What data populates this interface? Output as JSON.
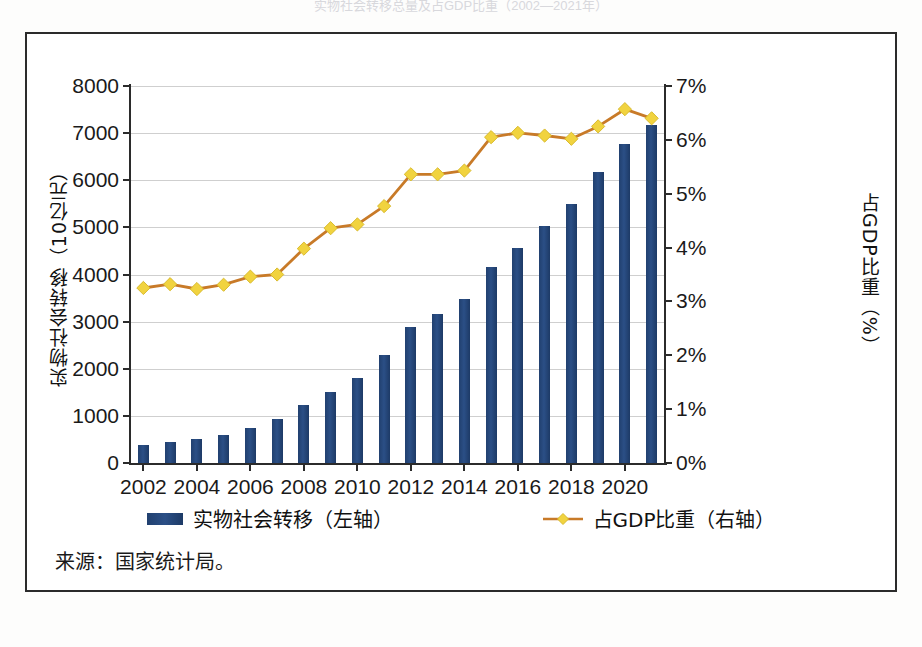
{
  "figure": {
    "title_faint": "实物社会转移总量及占GDP比重（2002—2021年）",
    "source_note": "来源：国家统计局。"
  },
  "axes": {
    "left_title": "实物社会转移（10亿元）",
    "right_title": "占GDP比重（%）",
    "left_ticks": [
      "0",
      "1000",
      "2000",
      "3000",
      "4000",
      "5000",
      "6000",
      "7000",
      "8000"
    ],
    "right_ticks": [
      "0%",
      "1%",
      "2%",
      "3%",
      "4%",
      "5%",
      "6%",
      "7%"
    ],
    "x_ticks": [
      "2002",
      "2004",
      "2006",
      "2008",
      "2010",
      "2012",
      "2014",
      "2016",
      "2018",
      "2020"
    ]
  },
  "legend": {
    "bar_label": "实物社会转移（左轴）",
    "line_label": "占GDP比重（右轴）"
  },
  "colors": {
    "bar": "#21406f",
    "line": "#c87a28",
    "marker": "#f1d33f",
    "grid": "#cfcfcf",
    "axis": "#2b2b2b"
  },
  "chart_data": {
    "type": "bar",
    "title": "实物社会转移总量及占GDP比重（2002—2021年）",
    "xlabel": "",
    "ylabel": "实物社会转移（10亿元）",
    "y2label": "占GDP比重（%）",
    "ylim": [
      0,
      8000
    ],
    "y2lim": [
      0,
      7
    ],
    "grid": true,
    "legend_position": "bottom",
    "categories": [
      "2002",
      "2003",
      "2004",
      "2005",
      "2006",
      "2007",
      "2008",
      "2009",
      "2010",
      "2011",
      "2012",
      "2013",
      "2014",
      "2015",
      "2016",
      "2017",
      "2018",
      "2019",
      "2020",
      "2021"
    ],
    "series": [
      {
        "name": "实物社会转移（左轴）",
        "type": "bar",
        "axis": "left",
        "unit": "10亿元",
        "values": [
          390,
          450,
          510,
          600,
          740,
          930,
          1240,
          1500,
          1800,
          2290,
          2890,
          3170,
          3490,
          4170,
          4570,
          5020,
          5500,
          6180,
          6780,
          7180
        ]
      },
      {
        "name": "占GDP比重（右轴）",
        "type": "line",
        "axis": "right",
        "unit": "%",
        "values": [
          3.25,
          3.32,
          3.23,
          3.31,
          3.46,
          3.5,
          3.98,
          4.36,
          4.43,
          4.77,
          5.36,
          5.36,
          5.43,
          6.05,
          6.13,
          6.08,
          6.02,
          6.25,
          6.57,
          6.4
        ]
      }
    ]
  }
}
